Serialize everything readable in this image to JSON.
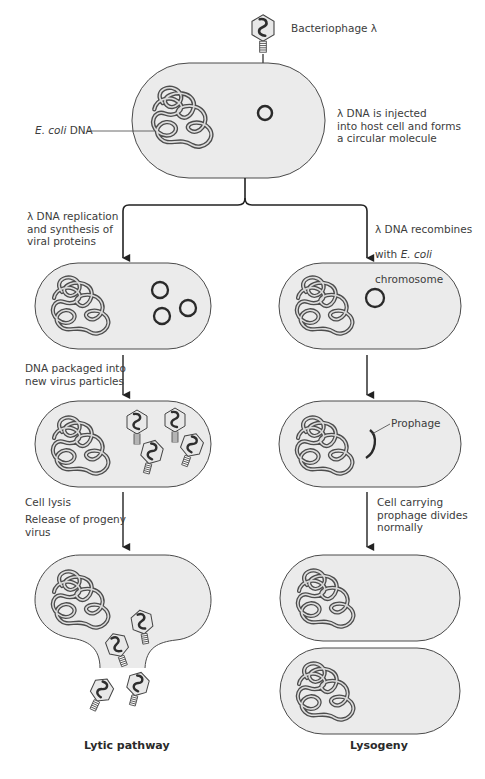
{
  "figure": {
    "phage_label": "Bacteriophage λ",
    "ecoli_dna_label_italic": "E. coli",
    "ecoli_dna_label_rest": " DNA",
    "step1": "λ DNA is injected\ninto host cell and forms\na circular molecule",
    "lytic": {
      "step2": "λ DNA replication\nand synthesis of\nviral proteins",
      "step3": "DNA packaged into\nnew virus particles",
      "step4a": "Cell lysis",
      "step4b": "Release of progeny\nvirus",
      "title": "Lytic pathway"
    },
    "lysogeny": {
      "step2_line1": "λ DNA recombines",
      "step2_line2_pre": "with ",
      "step2_line2_italic": "E. coli",
      "step2_line3": "chromosome",
      "prophage_label": "Prophage",
      "step3": "Cell carrying\nprophage divides\nnormally",
      "title": "Lysogeny"
    }
  },
  "colors": {
    "cell_fill": "#ebebeb",
    "cell_stroke": "#4a4a4a",
    "dna_stroke": "#4d4d4d",
    "arrow": "#222222"
  }
}
